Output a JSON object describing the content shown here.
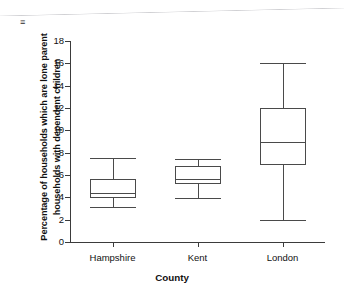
{
  "chart": {
    "xlabel": "County",
    "ylabel_line1": "Percentage of households which are lone parent",
    "ylabel_line2": "households with dependent children"
  },
  "chart_data": {
    "type": "box",
    "title": "",
    "xlabel": "County",
    "ylabel": "Percentage of households which are lone parent households with dependent children",
    "categories": [
      "Hampshire",
      "Kent",
      "London"
    ],
    "ylim": [
      0,
      18
    ],
    "yticks": [
      0,
      2,
      4,
      6,
      8,
      10,
      12,
      14,
      16,
      18
    ],
    "ytick_labels": [
      "0",
      "2",
      "4",
      "6",
      "8",
      "10",
      "12",
      "14",
      "16",
      "18"
    ],
    "grid": false,
    "legend": "none",
    "series": [
      {
        "name": "Hampshire",
        "min": 3.1,
        "q1": 3.9,
        "median": 4.35,
        "q3": 5.6,
        "max": 7.5
      },
      {
        "name": "Kent",
        "min": 3.9,
        "q1": 5.2,
        "median": 5.6,
        "q3": 6.8,
        "max": 7.4
      },
      {
        "name": "London",
        "min": 2.0,
        "q1": 6.9,
        "median": 9.0,
        "q3": 12.0,
        "max": 16.0
      }
    ]
  },
  "colors": {
    "line": "#4a4a4a",
    "axis": "#3b3b3b",
    "text": "#111111",
    "background": "#ffffff"
  }
}
